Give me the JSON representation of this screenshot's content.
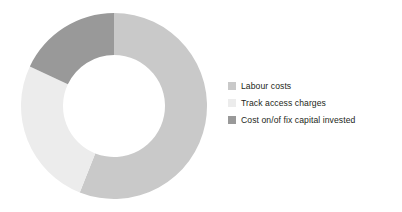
{
  "chart_data": {
    "type": "pie",
    "variant": "donut",
    "title": "",
    "subtitle": "",
    "xlabel": "",
    "ylabel": "",
    "grid": false,
    "legend_position": "right",
    "start_angle_deg": 0,
    "direction": "clockwise",
    "center": {
      "x": 114,
      "y": 106
    },
    "outer_radius": 93,
    "inner_radius": 51,
    "categories": [
      "Labour costs",
      "Track access charges",
      "Cost on/of fix capital invested"
    ],
    "values": [
      56,
      26,
      18
    ],
    "value_unit": "%",
    "colors": [
      "#c9c9c9",
      "#ececec",
      "#999999"
    ],
    "slices": [
      {
        "label": "Labour costs",
        "value": 56,
        "color": "#c9c9c9",
        "start_deg": 0,
        "end_deg": 201.6
      },
      {
        "label": "Track access charges",
        "value": 26,
        "color": "#ececec",
        "start_deg": 201.6,
        "end_deg": 295.2
      },
      {
        "label": "Cost on/of fix capital invested",
        "value": 18,
        "color": "#999999",
        "start_deg": 295.2,
        "end_deg": 360
      }
    ],
    "annotations": []
  },
  "legend": {
    "items": [
      {
        "label": "Labour costs",
        "color": "#c9c9c9"
      },
      {
        "label": "Track access charges",
        "color": "#ececec"
      },
      {
        "label": "Cost on/of fix capital invested",
        "color": "#999999"
      }
    ]
  },
  "colors": {
    "background": "#ffffff",
    "text": "#231f20"
  }
}
